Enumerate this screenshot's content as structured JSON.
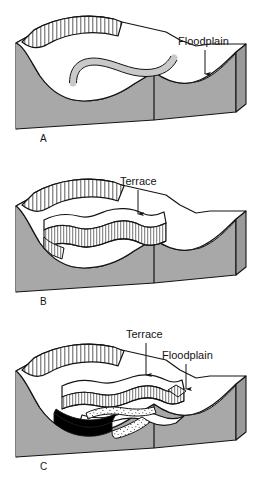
{
  "figure": {
    "type": "block-diagram",
    "panel_count": 3,
    "colors": {
      "bedrock_gray": "#a8a8a8",
      "bedrock_gray_dark": "#9a9a9a",
      "alluvium_white": "#ffffff",
      "channel_gray": "#c9c9c9",
      "ink": "#141414",
      "black_fill": "#000000",
      "background": "#ffffff"
    }
  },
  "panels": [
    {
      "letter": "A",
      "labels": [
        {
          "text": "Floodplain",
          "arrow": "down"
        }
      ]
    },
    {
      "letter": "B",
      "labels": [
        {
          "text": "Terrace",
          "arrow": "down"
        }
      ]
    },
    {
      "letter": "C",
      "labels": [
        {
          "text": "Terrace",
          "arrow": "down"
        },
        {
          "text": "Floodplain",
          "arrow": "down"
        }
      ]
    }
  ],
  "text": {
    "floodplain_a": "Floodplain",
    "letter_a": "A",
    "terrace_b": "Terrace",
    "letter_b": "B",
    "terrace_c": "Terrace",
    "floodplain_c": "Floodplain",
    "letter_c": "C"
  }
}
